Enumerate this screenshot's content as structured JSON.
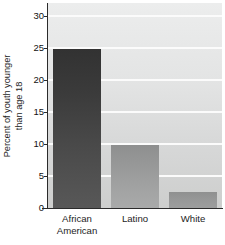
{
  "chart_data": {
    "type": "bar",
    "title": "",
    "subtitle": "",
    "xlabel": "",
    "ylabel": "Percent of youth younger than age 18",
    "ylabel_lines": [
      "Percent of youth younger",
      "than age 18"
    ],
    "categories": [
      "African American",
      "Latino",
      "White"
    ],
    "category_lines": [
      [
        "African",
        "American"
      ],
      [
        "Latino"
      ],
      [
        "White"
      ]
    ],
    "values": [
      24.8,
      9.9,
      2.5
    ],
    "ylim": [
      0,
      32
    ],
    "yticks": [
      0,
      5,
      10,
      15,
      20,
      25,
      30
    ],
    "ytick_labels": [
      "0",
      "5",
      "10",
      "15",
      "20",
      "25",
      "30"
    ],
    "grid": true,
    "grid_axis": "y",
    "legend": false,
    "legend_position": "none",
    "bar_colors": [
      "#3f3f3f",
      "#9b9c9c",
      "#979898"
    ],
    "plot_background": "#e3e4e4",
    "gridline_color": "#fbfbfb",
    "axis_color": "#2b2b2b"
  }
}
